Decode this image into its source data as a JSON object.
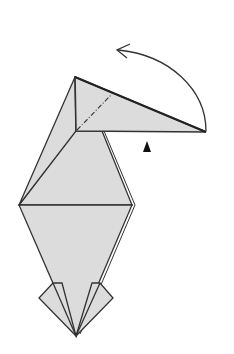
{
  "diagram": {
    "type": "origami-fold-diagram",
    "colors": {
      "paper": "#dcdcdc",
      "line": "#333333",
      "background": "#ffffff",
      "marker": "#111111"
    },
    "elements": {
      "fold_arrow": {
        "direction": "counterclockwise",
        "label": ""
      },
      "valley_fold_line": {
        "style": "dash-dot"
      },
      "pivot_marker": {
        "shape": "filled-triangle"
      }
    }
  }
}
